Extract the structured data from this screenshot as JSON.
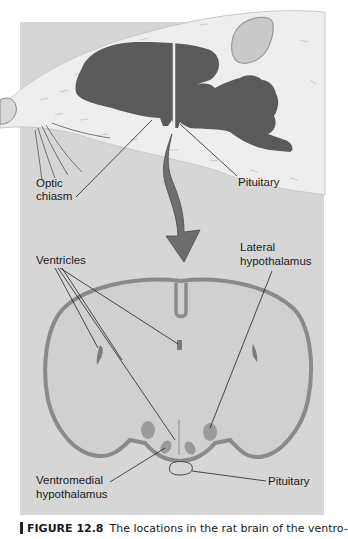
{
  "figure": {
    "top_labels": {
      "optic_chiasm_line1": "Optic",
      "optic_chiasm_line2": "chiasm",
      "pituitary": "Pituitary"
    },
    "bottom_labels": {
      "ventricles": "Ventricles",
      "lateral_line1": "Lateral",
      "lateral_line2": "hypothalamus",
      "ventromedial_line1": "Ventromedial",
      "ventromedial_line2": "hypothalamus",
      "pituitary": "Pituitary"
    },
    "caption": {
      "number": "FIGURE 12.8",
      "text": "The locations in the rat brain of the ventro-"
    },
    "colors": {
      "panel_bg": "#d6d6d6",
      "brain_dark": "#5a5a5a",
      "cortex_band": "#8a8a8a",
      "nuclei": "#9a9a9a",
      "fur": "#eeeeee"
    }
  }
}
